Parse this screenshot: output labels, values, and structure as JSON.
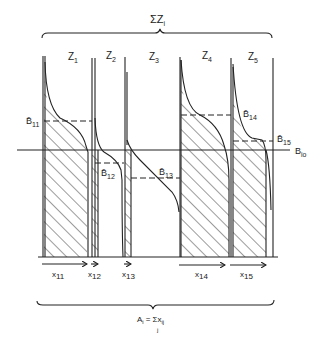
{
  "top_brace": {
    "label": "ΣZ",
    "subscript": "i"
  },
  "zones": [
    {
      "label": "Z",
      "sub": "1"
    },
    {
      "label": "Z",
      "sub": "2"
    },
    {
      "label": "Z",
      "sub": "3"
    },
    {
      "label": "Z",
      "sub": "4"
    },
    {
      "label": "Z",
      "sub": "5"
    }
  ],
  "b_levels": [
    {
      "label": "B̄",
      "sub": "11"
    },
    {
      "label": "B̄",
      "sub": "12"
    },
    {
      "label": "B̄",
      "sub": "13"
    },
    {
      "label": "B̄",
      "sub": "14"
    },
    {
      "label": "B̄",
      "sub": "15"
    }
  ],
  "reference_line": {
    "label": "B",
    "sub": "io"
  },
  "x_labels": [
    {
      "label": "x",
      "sub": "11"
    },
    {
      "label": "x",
      "sub": "12"
    },
    {
      "label": "x",
      "sub": "13"
    },
    {
      "label": "x",
      "sub": "14"
    },
    {
      "label": "x",
      "sub": "15"
    }
  ],
  "bottom_brace": {
    "label": "A",
    "sub": "i",
    "eq": "= Σx",
    "eq_sub": "ij",
    "under": "j"
  },
  "colors": {
    "ink": "#222222",
    "background": "#ffffff"
  }
}
